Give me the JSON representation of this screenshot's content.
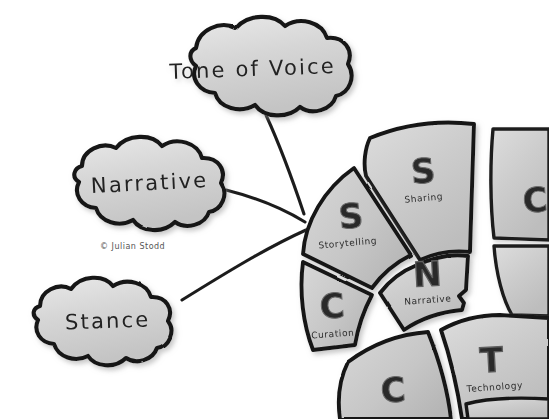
{
  "canvas": {
    "width": 549,
    "height": 419,
    "background": "#ffffff"
  },
  "credit": {
    "text": "© Julian Stodd"
  },
  "palette": {
    "ink": "#1a1a1a",
    "cloud_fill": "#d4d4d4",
    "cloud_fill_light": "#e3e3e3",
    "segment_fill": "#c9c9c9",
    "segment_fill_light": "#dadada",
    "letter_gray": "#8f8f8f",
    "letter_white": "#ffffff",
    "shadow": "#b8b8b8",
    "text": "#2b2b2b"
  },
  "clouds": [
    {
      "id": "tone-of-voice",
      "label": "Tone of Voice",
      "cx": 253,
      "cy": 70,
      "rx": 92,
      "ry": 46
    },
    {
      "id": "narrative",
      "label": "Narrative",
      "cx": 148,
      "cy": 182,
      "rx": 82,
      "ry": 42
    },
    {
      "id": "stance",
      "label": "Stance",
      "cx": 108,
      "cy": 320,
      "rx": 78,
      "ry": 41
    }
  ],
  "connectors": [
    {
      "id": "connector-tone-of-voice",
      "from": "tone-of-voice",
      "to": "wheel-hub"
    },
    {
      "id": "connector-narrative",
      "from": "narrative",
      "to": "wheel-hub"
    },
    {
      "id": "connector-stance",
      "from": "stance",
      "to": "wheel-hub"
    }
  ],
  "wheel": {
    "id": "social-leadership-wheel",
    "hub": {
      "x": 470,
      "y": 258
    },
    "segments": [
      {
        "id": "sharing",
        "letter": "S",
        "name": "Sharing",
        "letter_style": "gray",
        "visible": "full"
      },
      {
        "id": "storytelling",
        "letter": "S",
        "name": "Storytelling",
        "letter_style": "gray",
        "visible": "full"
      },
      {
        "id": "curation",
        "letter": "C",
        "name": "Curation",
        "letter_style": "gray",
        "visible": "full"
      },
      {
        "id": "narrative-seg",
        "letter": "N",
        "name": "Narrative",
        "letter_style": "white",
        "visible": "full"
      },
      {
        "id": "technology",
        "letter": "T",
        "name": "Technology",
        "letter_style": "white",
        "visible": "partial"
      },
      {
        "id": "collaboration",
        "letter": "C",
        "name": "",
        "letter_style": "gray",
        "visible": "partial"
      },
      {
        "id": "edge-upper",
        "letter": "C",
        "name": "",
        "letter_style": "gray",
        "visible": "clipped"
      },
      {
        "id": "edge-mid",
        "letter": "",
        "name": "",
        "letter_style": "gray",
        "visible": "clipped"
      }
    ]
  }
}
